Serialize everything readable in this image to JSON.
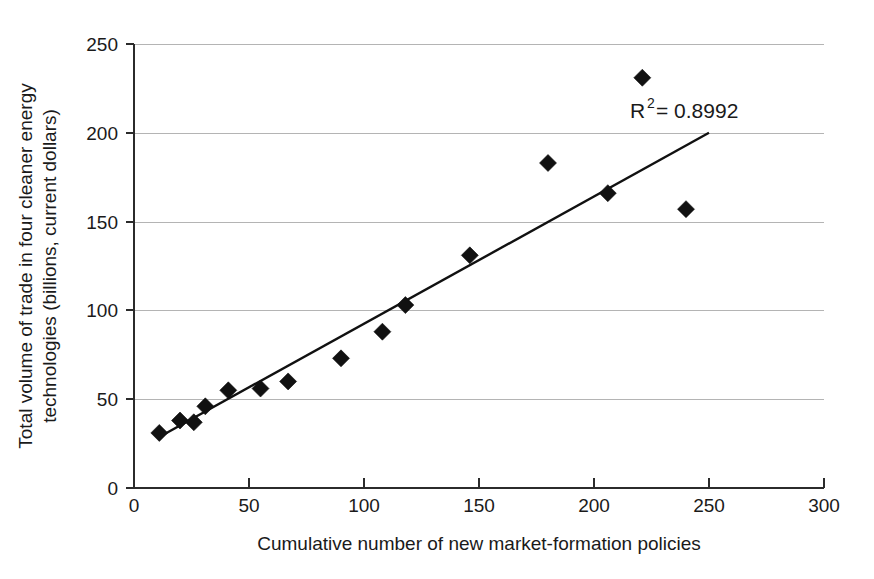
{
  "chart_data": {
    "type": "scatter",
    "title": "",
    "xlabel": "Cumulative number of new market-formation policies",
    "ylabel": "Total volume of trade in four cleaner energy technologies (billions, current dollars)",
    "xlim": [
      0,
      300
    ],
    "ylim": [
      0,
      250
    ],
    "xticks": [
      "0",
      "50",
      "100",
      "150",
      "200",
      "250",
      "300"
    ],
    "yticks": [
      "0",
      "50",
      "100",
      "150",
      "200",
      "250"
    ],
    "xtick_values": [
      0,
      50,
      100,
      150,
      200,
      250,
      300
    ],
    "ytick_values": [
      0,
      50,
      100,
      150,
      200,
      250
    ],
    "grid": "horizontal",
    "legend": "none",
    "marker_shape": "diamond",
    "marker_color": "#111111",
    "points": [
      {
        "x": 11,
        "y": 31
      },
      {
        "x": 20,
        "y": 38
      },
      {
        "x": 26,
        "y": 37
      },
      {
        "x": 31,
        "y": 46
      },
      {
        "x": 41,
        "y": 55
      },
      {
        "x": 55,
        "y": 56
      },
      {
        "x": 67,
        "y": 60
      },
      {
        "x": 90,
        "y": 73
      },
      {
        "x": 108,
        "y": 88
      },
      {
        "x": 118,
        "y": 103
      },
      {
        "x": 146,
        "y": 131
      },
      {
        "x": 180,
        "y": 183
      },
      {
        "x": 206,
        "y": 166
      },
      {
        "x": 221,
        "y": 231
      },
      {
        "x": 240,
        "y": 157
      }
    ],
    "trend_line": {
      "x_start": 10,
      "y_start": 28,
      "x_end": 250,
      "y_end": 200,
      "color": "#111111"
    },
    "annotations": [
      {
        "name": "r-squared",
        "prefix": "R",
        "superscript": "2",
        "suffix": " = 0.8992",
        "text": "R2 = 0.8992",
        "x": 228,
        "y": 212
      }
    ]
  }
}
